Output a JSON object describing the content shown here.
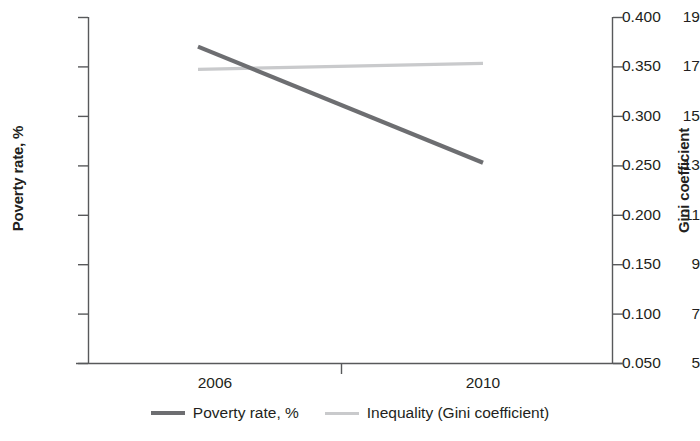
{
  "chart_data": {
    "type": "line",
    "title": "",
    "xlabel": "",
    "x": [
      2006,
      2010
    ],
    "xticklabels": [
      "2006",
      "2010"
    ],
    "xlim": [
      2005,
      2011
    ],
    "grid": false,
    "legend_position": "bottom",
    "axes": [
      {
        "side": "left",
        "ylabel": "Poverty rate, %",
        "ylim": [
          5,
          19
        ],
        "yticks": [
          5,
          7,
          9,
          11,
          13,
          15,
          17,
          19
        ],
        "yticklabels": [
          "5",
          "7",
          "9",
          "11",
          "13",
          "15",
          "17",
          "19"
        ]
      },
      {
        "side": "right",
        "ylabel": "Gini coefficient",
        "ylim": [
          0.05,
          0.4
        ],
        "yticks": [
          0.05,
          0.1,
          0.15,
          0.2,
          0.25,
          0.3,
          0.35,
          0.4
        ],
        "yticklabels": [
          "0.050",
          "0.100",
          "0.150",
          "0.200",
          "0.250",
          "0.300",
          "0.350",
          "0.400"
        ]
      }
    ],
    "series": [
      {
        "name": "Poverty rate, %",
        "axis": "left",
        "color": "#6d6e71",
        "values": [
          17.8,
          13.1
        ]
      },
      {
        "name": "Inequality (Gini coefficient)",
        "axis": "right",
        "color": "#c9cacc",
        "values": [
          0.347,
          0.353
        ]
      }
    ]
  },
  "legend": {
    "items": [
      {
        "label": "Poverty rate, %",
        "color": "#6d6e71"
      },
      {
        "label": "Inequality (Gini coefficient)",
        "color": "#c9cacc"
      }
    ]
  }
}
